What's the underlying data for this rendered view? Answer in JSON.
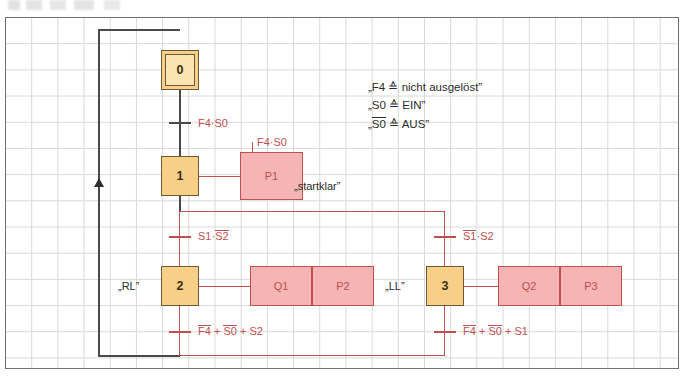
{
  "diagram": {
    "type": "grafcet-sequential-function-chart",
    "title": "",
    "colors": {
      "step_fill": "#f7cf86",
      "step_initial_inner_fill": "#fbe3b2",
      "step_border": "#6b5a36",
      "action_fill": "#f5b5b5",
      "action_border": "#c0504d",
      "line_dark": "#4a4a4a",
      "line_red": "#c0504d",
      "grid": "#d8d8d8",
      "canvas_border": "#6f6f6f"
    },
    "steps": [
      {
        "id": "step-0",
        "number": "0",
        "initial": true,
        "side_label": ""
      },
      {
        "id": "step-1",
        "number": "1",
        "initial": false,
        "side_label": ""
      },
      {
        "id": "step-2",
        "number": "2",
        "initial": false,
        "side_label": "„RL”"
      },
      {
        "id": "step-3",
        "number": "3",
        "initial": false,
        "side_label": "„LL”"
      }
    ],
    "actions": [
      {
        "id": "action-p1",
        "label": "P1",
        "comment": "„startklar”"
      },
      {
        "id": "action-q1",
        "label": "Q1",
        "comment": ""
      },
      {
        "id": "action-p2",
        "label": "P2",
        "comment": ""
      },
      {
        "id": "action-q2",
        "label": "Q2",
        "comment": ""
      },
      {
        "id": "action-p3",
        "label": "P3",
        "comment": ""
      }
    ],
    "transitions": [
      {
        "id": "t-0-1",
        "text": "F4·S0",
        "parts": [
          {
            "t": "F4",
            "bar": false
          },
          {
            "t": "·",
            "bar": false
          },
          {
            "t": "S0",
            "bar": false
          }
        ]
      },
      {
        "id": "t-1-2",
        "text": "S1·S2",
        "parts": [
          {
            "t": "S1",
            "bar": false
          },
          {
            "t": "·",
            "bar": false
          },
          {
            "t": "S2",
            "bar": true
          }
        ]
      },
      {
        "id": "t-1-3",
        "text": "S1·S2",
        "parts": [
          {
            "t": "S1",
            "bar": true
          },
          {
            "t": "·",
            "bar": false
          },
          {
            "t": "S2",
            "bar": false
          }
        ]
      },
      {
        "id": "t-2-0",
        "text": "F4 + S0 + S2",
        "parts": [
          {
            "t": "F4",
            "bar": true
          },
          {
            "t": " + ",
            "bar": false
          },
          {
            "t": "S0",
            "bar": true
          },
          {
            "t": " + ",
            "bar": false
          },
          {
            "t": "S2",
            "bar": false
          }
        ]
      },
      {
        "id": "t-3-0",
        "text": "F4 + S0 + S1",
        "parts": [
          {
            "t": "F4",
            "bar": true
          },
          {
            "t": " + ",
            "bar": false
          },
          {
            "t": "S0",
            "bar": true
          },
          {
            "t": " + ",
            "bar": false
          },
          {
            "t": "S1",
            "bar": false
          }
        ]
      }
    ],
    "action_conditions": [
      {
        "id": "cond-p1",
        "text": "F4·S0"
      }
    ],
    "legend": [
      {
        "id": "legend-line-1",
        "prefix": "„F4 ",
        "symbol": "≙",
        "suffix": " nicht ausgelöst”",
        "overline": false
      },
      {
        "id": "legend-line-2",
        "prefix": "„S0 ",
        "symbol": "≙",
        "suffix": " EIN”",
        "overline": false
      },
      {
        "id": "legend-line-3",
        "prefix": "„S0 ",
        "symbol": "≙",
        "suffix": " AUS”",
        "overline": true
      }
    ]
  }
}
